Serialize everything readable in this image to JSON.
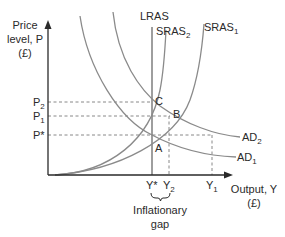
{
  "diagram": {
    "type": "AD-AS inflationary gap",
    "y_axis": {
      "line1": "Price",
      "line2": "level, P",
      "line3": "(£)"
    },
    "x_axis": {
      "line1": "Output, Y",
      "line2": "(£)"
    },
    "price_levels": [
      {
        "label": "P",
        "sub": "2",
        "y": 102
      },
      {
        "label": "P",
        "sub": "1",
        "y": 116
      },
      {
        "label": "P*",
        "sub": "",
        "y": 135
      }
    ],
    "output_levels": [
      {
        "label": "Y*",
        "sub": "",
        "x": 152
      },
      {
        "label": "Y",
        "sub": "2",
        "x": 169
      },
      {
        "label": "Y",
        "sub": "1",
        "x": 212
      }
    ],
    "curves": {
      "lras": "LRAS",
      "sras2": {
        "label": "SRAS",
        "sub": "2"
      },
      "sras1": {
        "label": "SRAS",
        "sub": "1"
      },
      "ad2": {
        "label": "AD",
        "sub": "2"
      },
      "ad1": {
        "label": "AD",
        "sub": "1"
      }
    },
    "points": {
      "a": "A",
      "b": "B",
      "c": "C"
    },
    "gap_label": {
      "line1": "Inflationary",
      "line2": "gap"
    }
  }
}
